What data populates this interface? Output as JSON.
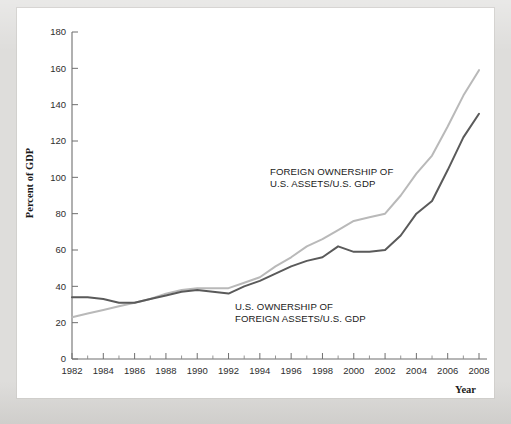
{
  "figure": {
    "background_color": "#ffffff",
    "page_color": "#dedddb"
  },
  "chart_data": {
    "type": "line",
    "title": "",
    "subtitle": "",
    "xlabel": "Year",
    "ylabel": "Percent of GDP",
    "xlim": [
      1982,
      2008
    ],
    "ylim": [
      0,
      180
    ],
    "grid": false,
    "legend_position": "inline-annotations",
    "x_tick_labels": [
      "1982",
      "1984",
      "1986",
      "1988",
      "1990",
      "1992",
      "1994",
      "1996",
      "1998",
      "2000",
      "2002",
      "2004",
      "2006",
      "2008"
    ],
    "x_tick_values": [
      1982,
      1984,
      1986,
      1988,
      1990,
      1992,
      1994,
      1996,
      1998,
      2000,
      2002,
      2004,
      2006,
      2008
    ],
    "x_minor_tick_values": [
      1983,
      1985,
      1987,
      1989,
      1991,
      1993,
      1995,
      1997,
      1999,
      2001,
      2003,
      2005,
      2007
    ],
    "y_tick_labels": [
      "0",
      "20",
      "40",
      "60",
      "80",
      "100",
      "120",
      "140",
      "160",
      "180"
    ],
    "y_tick_values": [
      0,
      20,
      40,
      60,
      80,
      100,
      120,
      140,
      160,
      180
    ],
    "x": [
      1982,
      1983,
      1984,
      1985,
      1986,
      1987,
      1988,
      1989,
      1990,
      1991,
      1992,
      1993,
      1994,
      1995,
      1996,
      1997,
      1998,
      1999,
      2000,
      2001,
      2002,
      2003,
      2004,
      2005,
      2006,
      2007,
      2008
    ],
    "series": [
      {
        "name": "FOREIGN OWNERSHIP OF U.S. ASSETS/U.S. GDP",
        "color": "#b9b9b9",
        "label_line1": "FOREIGN OWNERSHIP OF",
        "label_line2": "U.S. ASSETS/U.S. GDP",
        "values": [
          23,
          25,
          27,
          29,
          31,
          33,
          36,
          38,
          39,
          39,
          39,
          42,
          45,
          51,
          56,
          62,
          66,
          71,
          76,
          78,
          80,
          90,
          102,
          112,
          128,
          145,
          159
        ]
      },
      {
        "name": "U.S. OWNERSHIP OF FOREIGN ASSETS/U.S. GDP",
        "color": "#5a5a5a",
        "label_line1": "U.S. OWNERSHIP OF",
        "label_line2": "FOREIGN ASSETS/U.S. GDP",
        "values": [
          34,
          34,
          33,
          31,
          31,
          33,
          35,
          37,
          38,
          37,
          36,
          40,
          43,
          47,
          51,
          54,
          56,
          62,
          59,
          59,
          60,
          68,
          80,
          87,
          104,
          122,
          135
        ]
      }
    ],
    "annotations": [
      {
        "id": "annot-foreign",
        "line1": "FOREIGN OWNERSHIP OF",
        "line2": "U.S. ASSETS/U.S. GDP",
        "x_px": 253,
        "y_px": 167
      },
      {
        "id": "annot-us",
        "line1": "U.S. OWNERSHIP OF",
        "line2": "FOREIGN ASSETS/U.S. GDP",
        "x_px": 218,
        "y_px": 302
      }
    ]
  }
}
